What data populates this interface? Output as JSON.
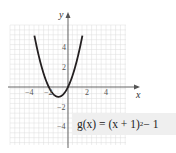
{
  "chart_data": {
    "type": "line",
    "title": "",
    "function_label": "g(x) = (x + 1)^2 − 1",
    "xlabel": "x",
    "ylabel": "y",
    "xlim": [
      -6,
      6
    ],
    "ylim": [
      -6,
      7
    ],
    "x_ticks": [
      -4,
      -2,
      2,
      4
    ],
    "y_ticks": [
      4,
      2,
      -2,
      -4
    ],
    "grid": true,
    "vertex": [
      -1,
      -1
    ],
    "series": [
      {
        "name": "g(x) = (x + 1)^2 − 1",
        "x": [
          -3.4,
          -3,
          -2.5,
          -2,
          -1.5,
          -1,
          -0.5,
          0,
          0.5,
          1,
          1.4
        ],
        "y": [
          4.76,
          3,
          1.25,
          0,
          -0.75,
          -1,
          -0.75,
          0,
          1.25,
          3,
          4.76
        ]
      }
    ]
  },
  "labels": {
    "x_axis": "x",
    "y_axis": "y",
    "tick_x_neg4": "−4",
    "tick_x_neg2": "−2",
    "tick_x_2": "2",
    "tick_x_4": "4",
    "tick_y_4": "4",
    "tick_y_2": "2",
    "tick_y_neg2": "−2",
    "tick_y_neg4": "−4"
  },
  "equation": {
    "lhs": "g(x) = (x + 1)",
    "exponent": "2",
    "rhs": " − 1"
  },
  "colors": {
    "curve": "#231f20",
    "axis": "#555555",
    "grid": "#dddddd",
    "equation_bg": "#efefef"
  }
}
